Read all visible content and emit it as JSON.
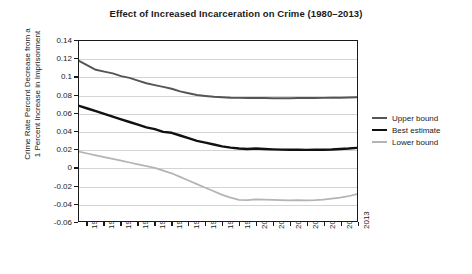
{
  "chart_data": {
    "type": "line",
    "title": "Effect of Increased Incarceration on Crime (1980–2013)",
    "xlabel": "",
    "ylabel": "Crime Rate Percent Decrease from a 1 Percent Increase in Imprisonment",
    "ylabel_line1": "Crime Rate Percent Decrease from a",
    "ylabel_line2": "1 Percent Increase in Imprisonment",
    "grid": true,
    "legend_position": "right",
    "xlim": [
      1980,
      2013
    ],
    "ylim": [
      -0.06,
      0.14
    ],
    "yticks": [
      0.14,
      0.12,
      0.1,
      0.08,
      0.06,
      0.04,
      0.02,
      0,
      -0.02,
      -0.04,
      -0.06
    ],
    "ytick_labels": [
      "0.14",
      "0.12",
      "0.1",
      "0.08",
      "0.06",
      "0.04",
      "0.02",
      "0",
      "-0.02",
      "-0.04",
      "-0.06"
    ],
    "xticks": [
      1981,
      1983,
      1985,
      1987,
      1989,
      1991,
      1993,
      1995,
      1997,
      1999,
      2001,
      2003,
      2005,
      2007,
      2009,
      2011,
      2013
    ],
    "xtick_labels": [
      "1981",
      "1983",
      "1985",
      "1987",
      "1989",
      "1991",
      "1993",
      "1995",
      "1997",
      "1999",
      "2001",
      "2003",
      "2005",
      "2007",
      "2009",
      "2011",
      "2013"
    ],
    "x": [
      1980,
      1981,
      1982,
      1983,
      1984,
      1985,
      1986,
      1987,
      1988,
      1989,
      1990,
      1991,
      1992,
      1993,
      1994,
      1995,
      1996,
      1997,
      1998,
      1999,
      2000,
      2001,
      2002,
      2003,
      2004,
      2005,
      2006,
      2007,
      2008,
      2009,
      2010,
      2011,
      2012,
      2013
    ],
    "series": [
      {
        "name": "Upper bound",
        "color": "#555555",
        "width": 2.0,
        "values": [
          0.118,
          0.113,
          0.108,
          0.106,
          0.104,
          0.101,
          0.099,
          0.096,
          0.093,
          0.091,
          0.089,
          0.087,
          0.084,
          0.082,
          0.08,
          0.079,
          0.078,
          0.0775,
          0.077,
          0.0768,
          0.0767,
          0.0766,
          0.0766,
          0.0765,
          0.0765,
          0.0765,
          0.0766,
          0.0766,
          0.0767,
          0.0768,
          0.0769,
          0.077,
          0.0772,
          0.0775
        ]
      },
      {
        "name": "Best estimate",
        "color": "#111111",
        "width": 2.4,
        "values": [
          0.068,
          0.065,
          0.062,
          0.059,
          0.056,
          0.053,
          0.05,
          0.047,
          0.044,
          0.042,
          0.039,
          0.038,
          0.035,
          0.032,
          0.029,
          0.027,
          0.025,
          0.023,
          0.0215,
          0.0205,
          0.02,
          0.0205,
          0.02,
          0.0196,
          0.0193,
          0.0192,
          0.0192,
          0.019,
          0.0192,
          0.0192,
          0.0195,
          0.02,
          0.0205,
          0.0212
        ]
      },
      {
        "name": "Lower bound",
        "color": "#b4b4b4",
        "width": 1.8,
        "values": [
          0.017,
          0.015,
          0.013,
          0.011,
          0.009,
          0.007,
          0.005,
          0.003,
          0.001,
          -0.001,
          -0.004,
          -0.007,
          -0.011,
          -0.015,
          -0.019,
          -0.023,
          -0.027,
          -0.031,
          -0.034,
          -0.0365,
          -0.0368,
          -0.036,
          -0.0362,
          -0.0365,
          -0.0368,
          -0.037,
          -0.0368,
          -0.037,
          -0.0368,
          -0.0362,
          -0.0352,
          -0.034,
          -0.0325,
          -0.03
        ]
      }
    ],
    "legend": [
      {
        "label": "Upper bound",
        "color": "#555555",
        "width": 2.0
      },
      {
        "label": "Best estimate",
        "color": "#111111",
        "width": 2.6
      },
      {
        "label": "Lower bound",
        "color": "#b4b4b4",
        "width": 1.8
      }
    ]
  }
}
